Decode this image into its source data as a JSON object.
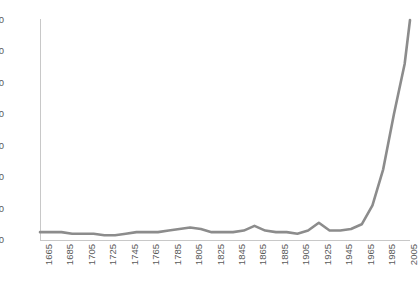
{
  "chart_data": {
    "type": "line",
    "title": "",
    "subtitle": "",
    "xlabel": "",
    "ylabel": "",
    "legend": [],
    "legend_position": "none",
    "grid": false,
    "xlim": [
      1665,
      2010
    ],
    "ylim": [
      0,
      140
    ],
    "yticks": [
      0,
      20,
      40,
      60,
      80,
      100,
      120,
      140
    ],
    "xticks": [
      1665,
      1685,
      1705,
      1725,
      1745,
      1765,
      1785,
      1805,
      1825,
      1845,
      1865,
      1885,
      1905,
      1925,
      1945,
      1965,
      1985,
      2005
    ],
    "xtick_rotation": 90,
    "line_color": "#8c8c8c",
    "axis_color": "#c8c8c8",
    "tick_label_color": "#5a5a5a",
    "background": "#ffffff",
    "series": [
      {
        "name": "series-1",
        "x": [
          1665,
          1675,
          1685,
          1695,
          1705,
          1715,
          1725,
          1735,
          1745,
          1755,
          1765,
          1775,
          1785,
          1795,
          1805,
          1815,
          1825,
          1835,
          1845,
          1855,
          1865,
          1875,
          1885,
          1895,
          1905,
          1915,
          1925,
          1935,
          1945,
          1955,
          1965,
          1975,
          1985,
          1995,
          2005,
          2010
        ],
        "values": [
          5,
          5,
          5,
          4,
          4,
          4,
          3,
          3,
          4,
          5,
          5,
          5,
          6,
          7,
          8,
          7,
          5,
          5,
          5,
          6,
          9,
          6,
          5,
          5,
          4,
          6,
          11,
          6,
          6,
          7,
          10,
          22,
          45,
          80,
          112,
          140
        ]
      }
    ]
  }
}
